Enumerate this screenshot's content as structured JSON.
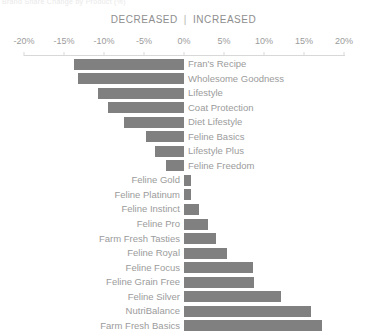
{
  "top_caption": "Brand Share Change by Product (%)",
  "legend": {
    "decreased_label": "DECREASED",
    "separator": "|",
    "increased_label": "INCREASED"
  },
  "axis": {
    "tick_labels": [
      "-20%",
      "-15%",
      "-10%",
      "-5%",
      "0%",
      "5%",
      "10%",
      "15%",
      "20%"
    ],
    "tick_values": [
      -20,
      -15,
      -10,
      -5,
      0,
      5,
      10,
      15,
      20
    ]
  },
  "colors": {
    "bar": "#808080",
    "text": "#9b9b9b",
    "axis": "#d8d8d8",
    "background": "#ffffff"
  },
  "chart_data": {
    "type": "bar",
    "orientation": "horizontal",
    "diverging": true,
    "title": "Brand Share Change by Product (%)",
    "subtitle": "DECREASED | INCREASED",
    "xlabel": "",
    "ylabel": "",
    "xlim": [
      -20,
      20
    ],
    "xtick_labels": [
      "-20%",
      "-15%",
      "-10%",
      "-5%",
      "0%",
      "5%",
      "10%",
      "15%",
      "20%"
    ],
    "xticks": [
      -20,
      -15,
      -10,
      -5,
      0,
      5,
      10,
      15,
      20
    ],
    "grid": false,
    "legend_position": "top-center",
    "unit": "%",
    "categories": [
      "Fran's Recipe",
      "Wholesome Goodness",
      "Lifestyle",
      "Coat Protection",
      "Diet Lifestyle",
      "Feline Basics",
      "Lifestyle Plus",
      "Feline Freedom",
      "Feline Gold",
      "Feline Platinum",
      "Feline Instinct",
      "Feline Pro",
      "Farm Fresh Tasties",
      "Feline Royal",
      "Feline Focus",
      "Feline Grain Free",
      "Feline Silver",
      "NutriBalance",
      "Farm Fresh Basics"
    ],
    "values": [
      -13.7,
      -13.2,
      -10.7,
      -9.5,
      -7.5,
      -4.7,
      -3.6,
      -2.2,
      0.9,
      0.9,
      1.9,
      3.0,
      4.0,
      5.4,
      8.6,
      8.7,
      12.1,
      15.9,
      17.2
    ]
  }
}
